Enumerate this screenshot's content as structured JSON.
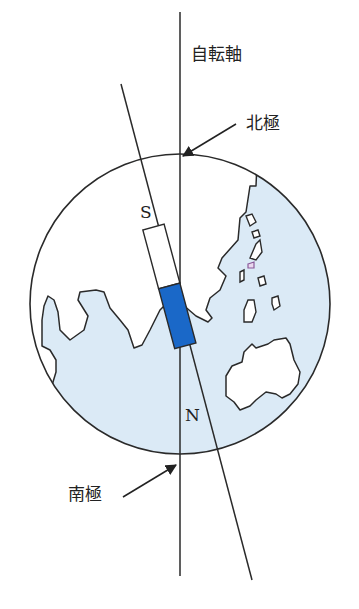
{
  "diagram": {
    "labels": {
      "rotation_axis": "自転軸",
      "north_pole": "北極",
      "south_pole": "南極",
      "magnet_s": "S",
      "magnet_n": "N"
    },
    "colors": {
      "ocean": "#dbeaf6",
      "land": "#ffffff",
      "outline": "#2a2a2a",
      "magnet_n_fill": "#1a68c8",
      "magnet_s_fill": "#ffffff",
      "background": "#ffffff"
    }
  }
}
